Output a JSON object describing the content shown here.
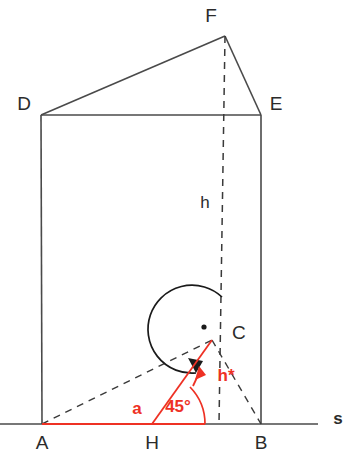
{
  "figure": {
    "background_color": "#ffffff",
    "solid_line_color": "#4a4a4a",
    "dashed_line_color": "#3a3a3a",
    "accent_color": "#ee3124",
    "label_color": "#2b2b2b"
  },
  "vertices": {
    "A": {
      "label": "A",
      "x": 42,
      "y": 424
    },
    "B": {
      "label": "B",
      "x": 261,
      "y": 424
    },
    "C": {
      "label": "C",
      "x": 212,
      "y": 340
    },
    "D": {
      "label": "D",
      "x": 41,
      "y": 115
    },
    "E": {
      "label": "E",
      "x": 261,
      "y": 115
    },
    "F": {
      "label": "F",
      "x": 225,
      "y": 36
    },
    "H": {
      "label": "H",
      "x": 152,
      "y": 424
    }
  },
  "dimensions": {
    "height_label": "h",
    "slant_height_label": "h*",
    "side_label": "a"
  },
  "angles": {
    "base_angle_label": "45°",
    "base_angle_value": 45,
    "right_angle_marker": "right-angle-dot",
    "right_angle_value": 90
  },
  "axis": {
    "label": "s",
    "name": "base-line"
  },
  "legend_notes": {
    "red_elements": [
      "a",
      "45°",
      "h*"
    ],
    "black_elements": [
      "A",
      "B",
      "C",
      "D",
      "E",
      "F",
      "H",
      "h",
      "s"
    ]
  }
}
